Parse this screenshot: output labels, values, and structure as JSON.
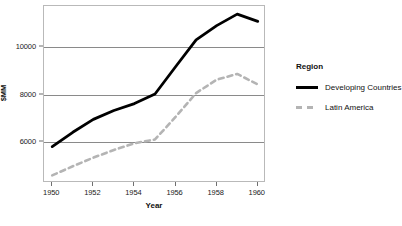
{
  "chart_data": {
    "type": "line",
    "title": "",
    "xlabel": "Year",
    "ylabel": "$MM",
    "x": [
      1950,
      1951,
      1952,
      1953,
      1954,
      1955,
      1956,
      1957,
      1958,
      1959,
      1960
    ],
    "xlim": [
      1949.6,
      1960.4
    ],
    "ylim": [
      4300,
      11700
    ],
    "xticks": [
      1950,
      1952,
      1954,
      1956,
      1958,
      1960
    ],
    "xtick_labels": [
      "1950",
      "1952",
      "1954",
      "1956",
      "1958",
      "1960"
    ],
    "yticks": [
      6000,
      8000,
      10000
    ],
    "ytick_labels": [
      "6000",
      "8000",
      "10000"
    ],
    "grid": "horizontal",
    "legend_position": "right",
    "legend_title": "Region",
    "series": [
      {
        "name": "Developing Countries",
        "style": "solid",
        "color": "#000000",
        "values": [
          5820,
          6420,
          6960,
          7330,
          7620,
          8020,
          9160,
          10280,
          10880,
          11360,
          11060
        ]
      },
      {
        "name": "Latin America",
        "style": "dashed",
        "color": "#b4b4b4",
        "values": [
          4620,
          5000,
          5360,
          5680,
          5960,
          6120,
          7060,
          8060,
          8620,
          8860,
          8420
        ]
      }
    ]
  },
  "axes": {
    "y_title": "$MM",
    "x_title": "Year"
  },
  "legend": {
    "title": "Region",
    "items": [
      {
        "label": "Developing Countries",
        "style": "solid"
      },
      {
        "label": "Latin America",
        "style": "dashed"
      }
    ]
  },
  "colors": {
    "series_primary": "#000000",
    "series_secondary": "#b4b4b4",
    "gridline": "#8a8a8a",
    "frame": "#b9b9b9",
    "text": "#111111",
    "background": "#ffffff"
  }
}
